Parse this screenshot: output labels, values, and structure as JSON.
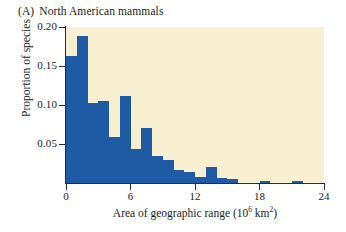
{
  "caption": {
    "letter": "(A)",
    "text": "North American mammals"
  },
  "axes": {
    "y_title": "Proportion of species",
    "x_title_main": "Area of geographic range (10",
    "x_title_exp1": "6",
    "x_title_mid": " km",
    "x_title_exp2": "2",
    "x_title_end": ")",
    "y_ticks": [
      "0.20",
      "0.15",
      "0.10",
      "0.05"
    ],
    "x_ticks": [
      "0",
      "6",
      "12",
      "18",
      "24"
    ]
  },
  "colors": {
    "bar": "#1f5ba4",
    "panel_background": "#f7efcf",
    "axis": "#2b2b2b",
    "page_background": "#ffffff"
  },
  "chart_data": {
    "type": "bar",
    "title": "North American mammals",
    "xlabel": "Area of geographic range (10^6 km^2)",
    "ylabel": "Proportion of species",
    "xlim": [
      0,
      24
    ],
    "ylim": [
      0,
      0.2
    ],
    "grid": false,
    "legend": "none",
    "bin_width": 1,
    "bin_units": "10^6 km^2",
    "bin_starts": [
      0,
      1,
      2,
      3,
      4,
      5,
      6,
      7,
      8,
      9,
      10,
      11,
      12,
      13,
      14,
      15,
      16,
      17,
      18,
      19,
      20,
      21,
      22,
      23
    ],
    "categories": [
      "0-1",
      "1-2",
      "2-3",
      "3-4",
      "4-5",
      "5-6",
      "6-7",
      "7-8",
      "8-9",
      "9-10",
      "10-11",
      "11-12",
      "12-13",
      "13-14",
      "14-15",
      "15-16",
      "16-17",
      "17-18",
      "18-19",
      "19-20",
      "20-21",
      "21-22",
      "22-23",
      "23-24"
    ],
    "values": [
      0.163,
      0.188,
      0.103,
      0.105,
      0.059,
      0.111,
      0.044,
      0.071,
      0.035,
      0.03,
      0.017,
      0.014,
      0.008,
      0.02,
      0.006,
      0.005,
      0.0,
      0.0,
      0.002,
      0.0,
      0.0,
      0.002,
      0.0,
      0.0
    ]
  }
}
